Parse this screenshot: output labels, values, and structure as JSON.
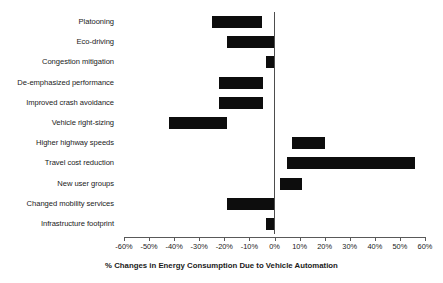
{
  "chart_data": {
    "type": "bar",
    "orientation": "horizontal",
    "style": "floating-range-bar",
    "title": "",
    "subtitle": "",
    "xlabel": "% Changes in Energy Consumption Due to Vehicle Automation",
    "ylabel": "",
    "xlim": [
      -60,
      60
    ],
    "xtick_step": 10,
    "xticks": [
      "-60%",
      "-50%",
      "-40%",
      "-30%",
      "-20%",
      "-10%",
      "0%",
      "10%",
      "20%",
      "30%",
      "40%",
      "50%",
      "60%"
    ],
    "xtick_values": [
      -60,
      -50,
      -40,
      -30,
      -20,
      -10,
      0,
      10,
      20,
      30,
      40,
      50,
      60
    ],
    "grid": false,
    "legend": null,
    "bar_color": "#0d0d0d",
    "zero_line_color": "#4d4d4d",
    "categories": [
      "Platooning",
      "Eco-driving",
      "Congestion mitigation",
      "De-emphasized performance",
      "Improved crash avoidance",
      "Vehicle right-sizing",
      "Higher highway speeds",
      "Travel cost reduction",
      "New user groups",
      "Changed mobility services",
      "Infrastructure footprint"
    ],
    "ranges": [
      {
        "category": "Platooning",
        "low": -25,
        "high": -5
      },
      {
        "category": "Eco-driving",
        "low": -19,
        "high": 0
      },
      {
        "category": "Congestion mitigation",
        "low": -3.5,
        "high": 0
      },
      {
        "category": "De-emphasized performance",
        "low": -22,
        "high": -4.5
      },
      {
        "category": "Improved crash avoidance",
        "low": -22,
        "high": -4.5
      },
      {
        "category": "Vehicle right-sizing",
        "low": -42,
        "high": -19
      },
      {
        "category": "Higher highway speeds",
        "low": 7,
        "high": 20
      },
      {
        "category": "Travel cost reduction",
        "low": 5,
        "high": 56
      },
      {
        "category": "New user groups",
        "low": 2,
        "high": 11
      },
      {
        "category": "Changed mobility services",
        "low": -19,
        "high": 0
      },
      {
        "category": "Infrastructure footprint",
        "low": -3.5,
        "high": 0
      }
    ]
  }
}
